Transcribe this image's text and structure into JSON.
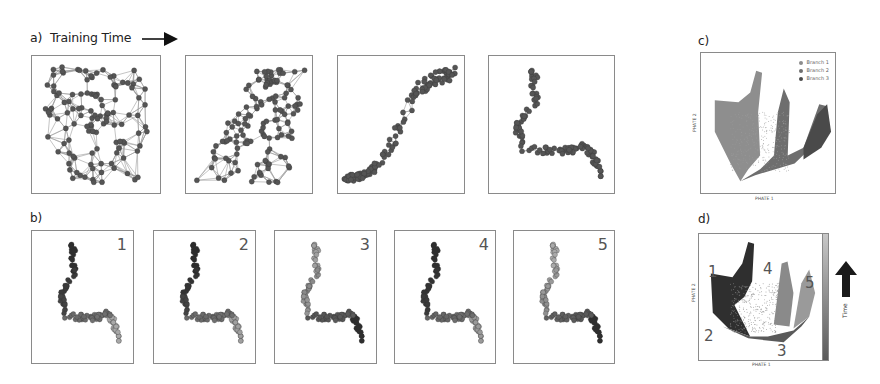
{
  "panel_a": {
    "label": "a)",
    "title": "Training Time",
    "arrow_icon": "right-arrow",
    "stages": [
      {
        "name": "stage-1",
        "layout": "random-tangled"
      },
      {
        "name": "stage-2",
        "layout": "partially-organized"
      },
      {
        "name": "stage-3",
        "layout": "s-curve"
      },
      {
        "name": "stage-4",
        "layout": "branching-trajectory"
      }
    ]
  },
  "panel_b": {
    "label": "b)",
    "panels": [
      {
        "number": "1"
      },
      {
        "number": "2"
      },
      {
        "number": "3"
      },
      {
        "number": "4"
      },
      {
        "number": "5"
      }
    ]
  },
  "panel_c": {
    "label": "c)",
    "xlabel": "PHATE 1",
    "ylabel": "PHATE 2",
    "legend": [
      {
        "label": "Branch 1",
        "color": "#8c8c8c"
      },
      {
        "label": "Branch 2",
        "color": "#6e6e6e"
      },
      {
        "label": "Branch 3",
        "color": "#4a4a4a"
      }
    ]
  },
  "panel_d": {
    "label": "d)",
    "xlabel": "PHATE 1",
    "ylabel": "PHATE 2",
    "annotations": [
      "1",
      "2",
      "3",
      "4",
      "5"
    ],
    "colorbar_label": "Time",
    "arrow_icon": "up-arrow"
  },
  "colors": {
    "node": "#555555",
    "edge": "#9a9a9a",
    "frame": "#8a8a8a",
    "dark": "#2e2e2e",
    "mid": "#6a6a6a",
    "light": "#a8a8a8"
  }
}
